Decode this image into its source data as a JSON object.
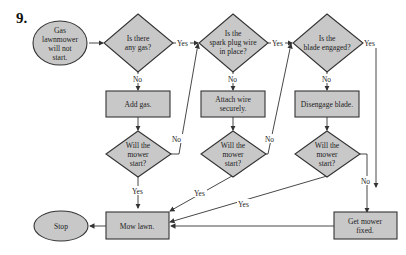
{
  "problem_number": "9.",
  "colors": {
    "shape_fill": "#c8c8c8",
    "stroke": "#333333",
    "background": "#ffffff"
  },
  "nodes": {
    "start": {
      "type": "terminal",
      "lines": [
        "Gas",
        "lawnmower",
        "will not",
        "start."
      ]
    },
    "q_gas": {
      "type": "decision",
      "lines": [
        "Is there",
        "any gas?"
      ]
    },
    "q_plug": {
      "type": "decision",
      "lines": [
        "Is the",
        "spark plug wire",
        "in place?"
      ]
    },
    "q_blade": {
      "type": "decision",
      "lines": [
        "Is the",
        "blade engaged?"
      ]
    },
    "add_gas": {
      "type": "process",
      "lines": [
        "Add gas."
      ]
    },
    "attach_wire": {
      "type": "process",
      "lines": [
        "Attach wire",
        "securely."
      ]
    },
    "disengage": {
      "type": "process",
      "lines": [
        "Disengage blade."
      ]
    },
    "q_start1": {
      "type": "decision",
      "lines": [
        "Will the",
        "mower",
        "start?"
      ]
    },
    "q_start2": {
      "type": "decision",
      "lines": [
        "Will the",
        "mower",
        "start?"
      ]
    },
    "q_start3": {
      "type": "decision",
      "lines": [
        "Will the",
        "mower",
        "start?"
      ]
    },
    "mow": {
      "type": "process",
      "lines": [
        "Mow lawn."
      ]
    },
    "fixed": {
      "type": "process",
      "lines": [
        "Get mower",
        "fixed."
      ]
    },
    "stop": {
      "type": "terminal",
      "lines": [
        "Stop"
      ]
    }
  },
  "edge_labels": {
    "gas_yes": "Yes",
    "gas_no": "No",
    "plug_yes": "Yes",
    "plug_no": "No",
    "blade_yes": "Yes",
    "blade_no": "No",
    "start1_yes": "Yes",
    "start1_no": "No",
    "start2_yes": "Yes",
    "start2_no": "No",
    "start3_yes": "Yes",
    "start3_no": "No"
  }
}
